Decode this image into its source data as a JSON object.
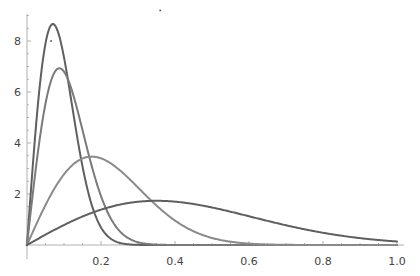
{
  "chart_data": {
    "type": "line",
    "title": "",
    "xlabel": "",
    "ylabel": "",
    "xlim": [
      0,
      1.0
    ],
    "ylim": [
      0,
      9
    ],
    "grid": false,
    "legend": null,
    "x_ticks": [
      "0.2",
      "0.4",
      "0.6",
      "0.8",
      "1.0"
    ],
    "x_tick_values": [
      0.2,
      0.4,
      0.6,
      0.8,
      1.0
    ],
    "y_ticks": [
      "2",
      "4",
      "6",
      "8"
    ],
    "y_tick_values": [
      2,
      4,
      6,
      8
    ],
    "annotations": [
      {
        "type": "dot",
        "x": 0.065,
        "y": 8.0
      },
      {
        "type": "dot",
        "x": 0.36,
        "y": 9.2
      }
    ],
    "series": [
      {
        "name": "curve-1",
        "distribution": "Rayleigh",
        "sigma": 0.07,
        "color": "#5f5f5f",
        "peak": {
          "x": 0.07,
          "y": 8.66
        },
        "x": [
          0,
          0.02,
          0.04,
          0.06,
          0.08,
          0.1,
          0.12,
          0.14,
          0.16,
          0.18,
          0.2,
          0.24,
          0.3,
          0.4,
          1.0
        ],
        "values": [
          0,
          3.92,
          6.94,
          8.48,
          8.5,
          7.36,
          5.64,
          3.87,
          2.4,
          1.35,
          0.69,
          0.14,
          0.0,
          0.0,
          0.0
        ]
      },
      {
        "name": "curve-2",
        "distribution": "Rayleigh",
        "sigma": 0.0875,
        "color": "#7a7a7a",
        "peak": {
          "x": 0.0875,
          "y": 6.93
        },
        "x": [
          0,
          0.02,
          0.04,
          0.06,
          0.08,
          0.1,
          0.12,
          0.14,
          0.16,
          0.18,
          0.2,
          0.24,
          0.28,
          0.32,
          0.4,
          1.0
        ],
        "values": [
          0,
          2.54,
          4.71,
          6.19,
          6.88,
          6.8,
          6.12,
          5.08,
          3.93,
          2.83,
          1.92,
          0.73,
          0.22,
          0.06,
          0.0,
          0.0
        ]
      },
      {
        "name": "curve-3",
        "distribution": "Rayleigh",
        "sigma": 0.175,
        "color": "#8a8a8a",
        "peak": {
          "x": 0.175,
          "y": 3.47
        },
        "x": [
          0,
          0.04,
          0.08,
          0.12,
          0.16,
          0.18,
          0.2,
          0.24,
          0.28,
          0.32,
          0.36,
          0.4,
          0.44,
          0.48,
          0.52,
          0.56,
          0.6,
          0.7,
          0.8,
          1.0
        ],
        "values": [
          0,
          1.27,
          2.35,
          3.1,
          3.44,
          3.46,
          3.4,
          3.07,
          2.54,
          1.96,
          1.42,
          0.96,
          0.61,
          0.37,
          0.21,
          0.11,
          0.05,
          0.01,
          0.0,
          0.0
        ]
      },
      {
        "name": "curve-4",
        "distribution": "Rayleigh",
        "sigma": 0.35,
        "color": "#5f5f5f",
        "peak": {
          "x": 0.35,
          "y": 1.73
        },
        "x": [
          0,
          0.05,
          0.1,
          0.15,
          0.2,
          0.25,
          0.3,
          0.35,
          0.4,
          0.45,
          0.5,
          0.55,
          0.6,
          0.65,
          0.7,
          0.75,
          0.8,
          0.85,
          0.9,
          0.95,
          1.0
        ],
        "values": [
          0,
          0.4,
          0.78,
          1.12,
          1.39,
          1.58,
          1.7,
          1.73,
          1.7,
          1.61,
          1.47,
          1.31,
          1.13,
          0.95,
          0.77,
          0.62,
          0.48,
          0.36,
          0.27,
          0.2,
          0.14
        ]
      }
    ]
  },
  "layout": {
    "origin_px": {
      "x": 27,
      "y": 245
    },
    "x_px_per_unit": 370,
    "y_px_per_unit": 25.5,
    "y_axis_top_px": 14,
    "x_axis_right_px": 404
  }
}
